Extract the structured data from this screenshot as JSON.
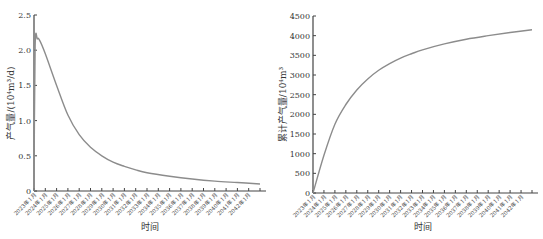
{
  "chart_data": [
    {
      "type": "line",
      "title": "",
      "xlabel": "时间",
      "ylabel": "产气量/(10⁴m³/d)",
      "ylim": [
        0,
        2.5
      ],
      "yticks": [
        "0",
        "0.5",
        "1.0",
        "1.5",
        "2.0",
        "2.5"
      ],
      "categories": [
        "2023年1月",
        "2024年1月",
        "2025年1月",
        "2026年1月",
        "2027年1月",
        "2028年1月",
        "2029年1月",
        "2030年1月",
        "2031年1月",
        "2032年1月",
        "2033年1月",
        "2034年1月",
        "2035年1月",
        "2036年1月",
        "2037年1月",
        "2038年1月",
        "2039年1月",
        "2040年1月",
        "2041年1月",
        "2042年1月"
      ],
      "series": [
        {
          "name": "产气量",
          "x": [
            0,
            0.1,
            0.3,
            0.5,
            1,
            2,
            3,
            4,
            5,
            6,
            7,
            8,
            9,
            10,
            12,
            14,
            16,
            18,
            20
          ],
          "values": [
            0,
            2.05,
            2.16,
            2.14,
            1.95,
            1.5,
            1.08,
            0.8,
            0.62,
            0.5,
            0.41,
            0.35,
            0.3,
            0.26,
            0.21,
            0.17,
            0.14,
            0.12,
            0.1
          ]
        }
      ],
      "grid": false
    },
    {
      "type": "line",
      "title": "",
      "xlabel": "时间",
      "ylabel": "累计产气量/10⁴m³",
      "ylim": [
        0,
        4500
      ],
      "yticks": [
        "0",
        "500",
        "1000",
        "1500",
        "2000",
        "2500",
        "3000",
        "3500",
        "4000",
        "4500"
      ],
      "categories": [
        "2023年1月",
        "2024年1月",
        "2025年1月",
        "2026年1月",
        "2027年1月",
        "2028年1月",
        "2029年1月",
        "2030年1月",
        "2031年1月",
        "2032年1月",
        "2033年1月",
        "2034年1月",
        "2035年1月",
        "2036年1月",
        "2037年1月",
        "2038年1月",
        "2039年1月",
        "2040年1月",
        "2041年1月",
        "2042年1月"
      ],
      "series": [
        {
          "name": "累计产气量",
          "x": [
            0,
            1,
            2,
            3,
            4,
            5,
            6,
            7,
            8,
            9,
            10,
            12,
            14,
            16,
            18,
            20
          ],
          "values": [
            0,
            960,
            1750,
            2250,
            2620,
            2900,
            3120,
            3290,
            3430,
            3540,
            3640,
            3790,
            3910,
            4000,
            4080,
            4150
          ]
        }
      ],
      "grid": false
    }
  ],
  "colors": {
    "line": "#8c8c8c",
    "axis": "#444444"
  }
}
